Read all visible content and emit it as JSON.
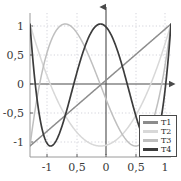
{
  "chart_data": {
    "type": "line",
    "title": "",
    "subtitle": "",
    "xlabel": "",
    "ylabel": "",
    "xlim": [
      -1,
      1
    ],
    "ylim": [
      -1.18,
      1.18
    ],
    "grid": true,
    "grid_style": "dotted",
    "legend_position": "lower-right",
    "axis_arrows": [
      "x-right",
      "y-up"
    ],
    "xticks": [
      -1,
      -0.5,
      0,
      0.5,
      1
    ],
    "xticklabels": [
      "-1",
      "0,5",
      "0",
      "0,5",
      "1"
    ],
    "yticks": [
      -1,
      -0.5,
      0,
      0.5,
      1
    ],
    "yticklabels": [
      "-1",
      "-0,5",
      "0",
      "0,5",
      "1"
    ],
    "x": [
      -1,
      -0.95,
      -0.9,
      -0.85,
      -0.8,
      -0.75,
      -0.7,
      -0.65,
      -0.6,
      -0.55,
      -0.5,
      -0.45,
      -0.4,
      -0.35,
      -0.3,
      -0.25,
      -0.2,
      -0.15,
      -0.1,
      -0.05,
      0,
      0.05,
      0.1,
      0.15,
      0.2,
      0.25,
      0.3,
      0.35,
      0.4,
      0.45,
      0.5,
      0.55,
      0.6,
      0.65,
      0.7,
      0.75,
      0.8,
      0.85,
      0.9,
      0.95,
      1
    ],
    "series": [
      {
        "name": "T1",
        "label": "T1",
        "color": "#8c8c8c",
        "formula": "T1(x) = x",
        "values": [
          -1,
          -0.95,
          -0.9,
          -0.85,
          -0.8,
          -0.75,
          -0.7,
          -0.65,
          -0.6,
          -0.55,
          -0.5,
          -0.45,
          -0.4,
          -0.35,
          -0.3,
          -0.25,
          -0.2,
          -0.15,
          -0.1,
          -0.05,
          0,
          0.05,
          0.1,
          0.15,
          0.2,
          0.25,
          0.3,
          0.35,
          0.4,
          0.45,
          0.5,
          0.55,
          0.6,
          0.65,
          0.7,
          0.75,
          0.8,
          0.85,
          0.9,
          0.95,
          1
        ]
      },
      {
        "name": "T2",
        "label": "T2",
        "color": "#d8d8d8",
        "formula": "T2(x) = 2x^2 - 1",
        "values": [
          1,
          0.805,
          0.62,
          0.445,
          0.28,
          0.125,
          -0.02,
          -0.155,
          -0.28,
          -0.395,
          -0.5,
          -0.595,
          -0.68,
          -0.755,
          -0.82,
          -0.875,
          -0.92,
          -0.955,
          -0.98,
          -0.995,
          -1,
          -0.995,
          -0.98,
          -0.955,
          -0.92,
          -0.875,
          -0.82,
          -0.755,
          -0.68,
          -0.595,
          -0.5,
          -0.395,
          -0.28,
          -0.155,
          -0.02,
          0.125,
          0.28,
          0.445,
          0.62,
          0.805,
          1
        ]
      },
      {
        "name": "T3",
        "label": "T3",
        "color": "#bfbfbf",
        "formula": "T3(x) = 4x^3 - 3x",
        "values": [
          -1,
          -0.58,
          -0.784,
          -0.104,
          0.352,
          0.703,
          0.928,
          1.052,
          1.016,
          0.884,
          0.5,
          0.986,
          0.944,
          0.879,
          0.792,
          0.688,
          0.568,
          0.436,
          0.296,
          0.15,
          0,
          -0.15,
          -0.296,
          -0.436,
          -0.568,
          -0.688,
          -0.792,
          -0.879,
          -0.944,
          -0.986,
          -1,
          -0.986,
          -0.944,
          -0.879,
          -0.792,
          -0.688,
          -0.568,
          -0.436,
          0.104,
          0.58,
          1
        ]
      },
      {
        "name": "T4",
        "label": "T4",
        "color": "#3c3c3c",
        "formula": "T4(x) = 8x^4 - 8x^2 + 1",
        "values": [
          1,
          0.296,
          -0.3,
          -0.74,
          -0.9232,
          -0.9922,
          -0.9992,
          -0.952,
          -0.8432,
          -0.6878,
          -0.5,
          -0.2922,
          -0.0752,
          0.1402,
          0.3448,
          0.5312,
          0.6928,
          0.8238,
          0.9208,
          0.9802,
          1,
          0.9802,
          0.9208,
          0.8238,
          0.6928,
          0.5312,
          0.3448,
          0.1402,
          -0.0752,
          -0.2922,
          -0.5,
          -0.6878,
          -0.8432,
          -0.952,
          -0.9992,
          -0.9922,
          -0.9232,
          -0.74,
          -0.3,
          0.296,
          1
        ]
      }
    ]
  },
  "legend": {
    "entries": [
      {
        "label": "T1",
        "color": "#8c8c8c"
      },
      {
        "label": "T2",
        "color": "#d8d8d8"
      },
      {
        "label": "T3",
        "color": "#bfbfbf"
      },
      {
        "label": "T4",
        "color": "#3c3c3c"
      }
    ]
  },
  "axes": {
    "frame_color": "#9a9a9a",
    "axis_color": "#4a4a4a",
    "grid_color": "#c8c8d2",
    "tick_label_color": "#3a3a3a"
  }
}
